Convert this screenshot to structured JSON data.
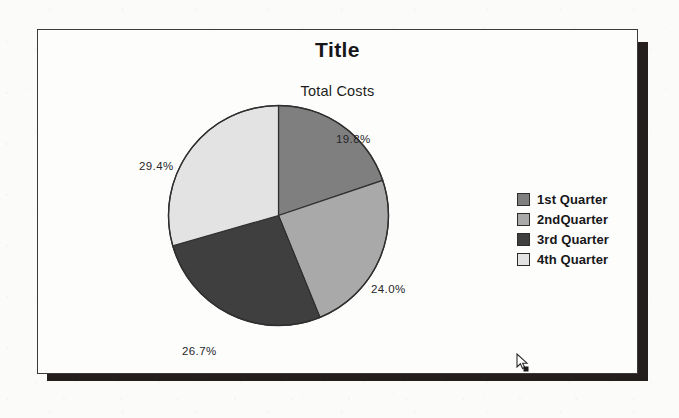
{
  "chart": {
    "title": "Title",
    "subtitle": "Total Costs"
  },
  "legend": {
    "items": [
      {
        "label": "1st Quarter",
        "color": "#7f7f7f"
      },
      {
        "label": "2ndQuarter",
        "color": "#a9a9a9"
      },
      {
        "label": "3rd Quarter",
        "color": "#3f3f3f"
      },
      {
        "label": "4th Quarter",
        "color": "#e3e3e3"
      }
    ]
  },
  "labels": {
    "q1": "19.8%",
    "q2": "24.0%",
    "q3": "26.7%",
    "q4": "29.4%"
  },
  "cursor": {
    "icon": "mouse-pointer-icon"
  },
  "chart_data": {
    "type": "pie",
    "title": "Title",
    "subtitle": "Total Costs",
    "categories": [
      "1st Quarter",
      "2ndQuarter",
      "3rd Quarter",
      "4th Quarter"
    ],
    "values": [
      19.8,
      24.0,
      26.7,
      29.4
    ],
    "value_labels": [
      "19.8%",
      "24.0%",
      "26.7%",
      "29.4%"
    ],
    "units": "percent",
    "colors": [
      "#7f7f7f",
      "#a9a9a9",
      "#3f3f3f",
      "#e3e3e3"
    ],
    "start_angle_deg": 0,
    "direction": "clockwise",
    "legend_position": "right",
    "grid": false,
    "xlabel": "",
    "ylabel": ""
  }
}
